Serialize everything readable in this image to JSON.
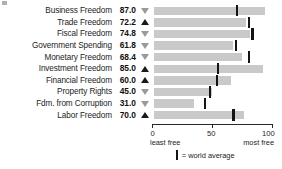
{
  "chart_data": {
    "type": "bar",
    "orientation": "horizontal",
    "title": "",
    "xlabel": "",
    "ylabel": "",
    "xlim": [
      0,
      100
    ],
    "grid": false,
    "categories": [
      "Business Freedom",
      "Trade Freedom",
      "Fiscal Freedom",
      "Government Spending",
      "Monetary Freedom",
      "Investment Freedom",
      "Financial Freedom",
      "Property Rights",
      "Fdm. from Corruption",
      "Labor Freedom"
    ],
    "values": [
      87.0,
      72.2,
      74.8,
      61.8,
      68.4,
      85.0,
      60.0,
      45.0,
      31.0,
      70.0
    ],
    "value_labels": [
      "87.0",
      "72.2",
      "74.8",
      "61.8",
      "68.4",
      "85.0",
      "60.0",
      "45.0",
      "31.0",
      "70.0"
    ],
    "series": [
      {
        "name": "Country score",
        "values": [
          87.0,
          72.2,
          74.8,
          61.8,
          68.4,
          85.0,
          60.0,
          45.0,
          31.0,
          70.0
        ]
      },
      {
        "name": "World average",
        "values": [
          65.0,
          74.0,
          77.0,
          64.0,
          74.0,
          50.0,
          49.0,
          44.0,
          40.0,
          62.0
        ]
      }
    ],
    "trend": [
      "down",
      "up",
      "down",
      "down",
      "down",
      "up",
      "up",
      "down",
      "down",
      "up"
    ],
    "trend_glyphs": [
      "▽",
      "▲",
      "▽",
      "▽",
      "▽",
      "▲",
      "▲",
      "▽",
      "▽",
      "▲"
    ],
    "rows": [
      {
        "label": "Business Freedom",
        "value": "87.0",
        "score": 87.0,
        "world_average": 65.0,
        "trend": "down"
      },
      {
        "label": "Trade Freedom",
        "value": "72.2",
        "score": 72.2,
        "world_average": 74.0,
        "trend": "up"
      },
      {
        "label": "Fiscal Freedom",
        "value": "74.8",
        "score": 74.8,
        "world_average": 77.0,
        "trend": "down"
      },
      {
        "label": "Government Spending",
        "value": "61.8",
        "score": 61.8,
        "world_average": 64.0,
        "trend": "down"
      },
      {
        "label": "Monetary Freedom",
        "value": "68.4",
        "score": 68.4,
        "world_average": 74.0,
        "trend": "down"
      },
      {
        "label": "Investment Freedom",
        "value": "85.0",
        "score": 85.0,
        "world_average": 50.0,
        "trend": "up"
      },
      {
        "label": "Financial Freedom",
        "value": "60.0",
        "score": 60.0,
        "world_average": 49.0,
        "trend": "up"
      },
      {
        "label": "Property Rights",
        "value": "45.0",
        "score": 45.0,
        "world_average": 44.0,
        "trend": "down"
      },
      {
        "label": "Fdm. from Corruption",
        "value": "31.0",
        "score": 31.0,
        "world_average": 40.0,
        "trend": "down"
      },
      {
        "label": "Labor Freedom",
        "value": "70.0",
        "score": 70.0,
        "world_average": 62.0,
        "trend": "up"
      }
    ],
    "axis": {
      "ticks": [
        0,
        50,
        100
      ],
      "tick_labels": [
        "0",
        "50",
        "100"
      ],
      "left_caption": "least free",
      "right_caption": "most free"
    },
    "legend": {
      "position": "bottom-center",
      "marker": "vertical-bar",
      "text": "= world average"
    },
    "colors": {
      "bar": "#c9c9c9",
      "average_mark": "#141414",
      "text": "#1c1c1c",
      "axis": "#2a2a2a",
      "trend_up": "#1a1a1a",
      "trend_down": "#9a9a9a"
    }
  }
}
